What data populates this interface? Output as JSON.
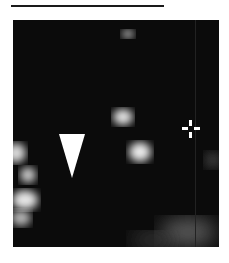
{
  "figure": {
    "type": "fluorescence-micrograph",
    "scale_bar": {
      "label": ""
    },
    "markers": [
      {
        "kind": "arrowhead",
        "direction": "down",
        "color": "#ffffff"
      },
      {
        "kind": "crosshair",
        "color": "#ffffff"
      }
    ],
    "colors": {
      "background": "#0b0b0b",
      "signal": "#e8e8e8",
      "page": "#ffffff"
    }
  }
}
